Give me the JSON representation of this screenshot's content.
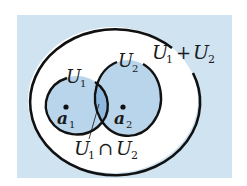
{
  "diagram": {
    "colors": {
      "page_background": "#ffffff",
      "panel_background": "#cfe3f1",
      "outer_region_fill": "#ffffff",
      "subspace_fill": "#b9d5ec",
      "intersection_fill": "#8fb8de",
      "stroke": "#111111"
    },
    "labels": {
      "sum": {
        "base1": "U",
        "sub1": "1",
        "op": "+",
        "base2": "U",
        "sub2": "2"
      },
      "u1": {
        "base": "U",
        "sub": "1"
      },
      "u2": {
        "base": "U",
        "sub": "2"
      },
      "a1": {
        "base": "a",
        "sub": "1"
      },
      "a2": {
        "base": "a",
        "sub": "2"
      },
      "intersection": {
        "base1": "U",
        "sub1": "1",
        "op": "∩",
        "base2": "U",
        "sub2": "2"
      }
    },
    "shapes": {
      "outer_ellipse": {
        "name": "U1 + U2",
        "cx": 113,
        "cy": 100,
        "rx": 85,
        "ry": 73
      },
      "circle_u1": {
        "name": "U1",
        "cx": 77,
        "cy": 105,
        "rx": 31,
        "ry": 29
      },
      "circle_u2": {
        "name": "U2",
        "cx": 128,
        "cy": 98,
        "rx": 33,
        "ry": 38
      },
      "point_a1": {
        "name": "a1",
        "x": 66,
        "y": 107
      },
      "point_a2": {
        "name": "a2",
        "x": 123,
        "y": 107
      }
    }
  }
}
